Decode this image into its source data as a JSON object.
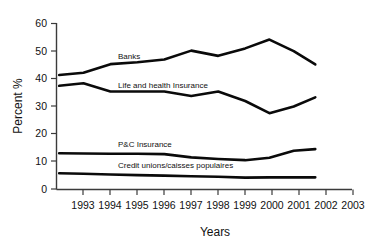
{
  "chart_data": {
    "type": "line",
    "title": "",
    "xlabel": "Years",
    "ylabel": "Percent %",
    "xlim": [
      1992.5,
      2003.5
    ],
    "ylim": [
      0,
      60
    ],
    "xticks": [
      "1993",
      "1994",
      "1995",
      "1996",
      "1997",
      "1998",
      "1999",
      "2000",
      "2001",
      "2002",
      "2003"
    ],
    "yticks": [
      "0",
      "10",
      "20",
      "30",
      "40",
      "50",
      "60"
    ],
    "grid": false,
    "legend_position": "inline-labels",
    "series": [
      {
        "name": "Banks",
        "label": "Banks",
        "x": [
          1992.6,
          1993.5,
          1994.5,
          1995.5,
          1996.5,
          1997.5,
          1998.5,
          1999.5,
          2000.4,
          2001.3,
          2002.1
        ],
        "values": [
          41.4,
          42.2,
          45.3,
          46.0,
          47.0,
          50.2,
          48.3,
          51.0,
          54.2,
          50.0,
          45.2
        ]
      },
      {
        "name": "Life and health Insurance",
        "label": "Life and health Insurance",
        "x": [
          1992.6,
          1993.5,
          1994.5,
          1995.5,
          1996.5,
          1997.5,
          1998.5,
          1999.5,
          2000.4,
          2001.3,
          2002.1
        ],
        "values": [
          37.5,
          38.4,
          35.4,
          35.4,
          35.4,
          33.8,
          35.4,
          32.0,
          27.6,
          30.0,
          33.3
        ]
      },
      {
        "name": "P&C Insurance",
        "label": "P&C Insurance",
        "x": [
          1992.6,
          1993.5,
          1994.5,
          1995.5,
          1996.5,
          1997.5,
          1998.5,
          1999.5,
          2000.4,
          2001.3,
          2002.1
        ],
        "values": [
          13.1,
          13.0,
          12.9,
          12.9,
          12.8,
          11.6,
          11.0,
          10.6,
          11.5,
          14.0,
          14.6
        ]
      },
      {
        "name": "Credit unions/caisses populaires",
        "label": "Credit unions/caisses populaires",
        "x": [
          1992.6,
          1993.5,
          1994.5,
          1995.5,
          1996.5,
          1997.5,
          1998.5,
          1999.5,
          2000.4,
          2001.3,
          2002.1
        ],
        "values": [
          5.9,
          5.7,
          5.4,
          5.2,
          5.0,
          4.8,
          4.6,
          4.3,
          4.4,
          4.4,
          4.4
        ]
      }
    ]
  },
  "axes": {
    "y_title": "Percent %",
    "x_title": "Years",
    "y_tick_labels": [
      "60",
      "50",
      "40",
      "30",
      "20",
      "10",
      "0"
    ],
    "x_tick_labels": [
      "1993",
      "1994",
      "1995",
      "1996",
      "1997",
      "1998",
      "1999",
      "2000",
      "2001",
      "2002",
      "2003"
    ]
  },
  "inline_labels": {
    "banks": "Banks",
    "life_health": "Life and health Insurance",
    "pc_insurance": "P&C Insurance",
    "credit_unions": "Credit unions/caisses populaires"
  },
  "colors": {
    "line": "#0a0a0a",
    "axis": "#3b3b3b",
    "text": "#111111",
    "background": "#ffffff"
  }
}
